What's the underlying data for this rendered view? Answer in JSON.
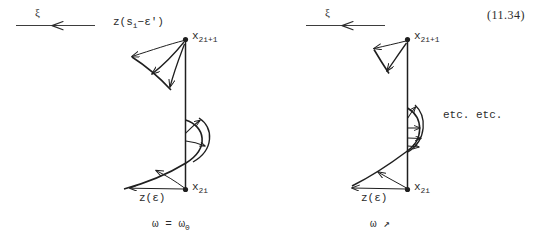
{
  "figure": {
    "equation_number": "(11.34)",
    "panels": [
      {
        "id": "left",
        "axis_symbol": "ξ",
        "axis_arrow_direction": "left",
        "labels": {
          "upper_vector": "z(s",
          "upper_vector_sub": "i",
          "upper_vector_tail": "−ε')",
          "top_point": "x",
          "top_point_sub": "2i+1",
          "lower_vector": "z(ε)",
          "bottom_point": "x",
          "bottom_point_sub": "2i"
        },
        "caption": "ω = ω",
        "caption_sub": "0"
      },
      {
        "id": "right",
        "axis_symbol": "ξ",
        "axis_arrow_direction": "left",
        "labels": {
          "top_point": "x",
          "top_point_sub": "2i+1",
          "lower_vector": "z(ε)",
          "bottom_point": "x",
          "bottom_point_sub": "2i",
          "etc": "etc. etc."
        },
        "caption": "ω ↗",
        "caption_sub": ""
      }
    ],
    "colors": {
      "ink": "#1f1f1f",
      "paper": "#ffffff",
      "faint_ink": "#4a4a4a"
    }
  }
}
